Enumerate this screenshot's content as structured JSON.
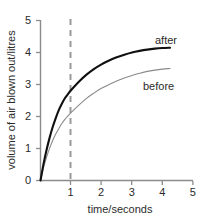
{
  "chart_data": {
    "type": "line",
    "title": "",
    "subtitle": "",
    "xlabel": "time/seconds",
    "ylabel": "volume of air blown out/litres",
    "xlim": [
      0,
      5
    ],
    "ylim": [
      0,
      5
    ],
    "xticks": [
      "1",
      "2",
      "3",
      "4",
      "5"
    ],
    "xtick_values": [
      1,
      2,
      3,
      4,
      5
    ],
    "yticks": [
      "0",
      "1",
      "2",
      "3",
      "4",
      "5"
    ],
    "ytick_values": [
      0,
      1,
      2,
      3,
      4,
      5
    ],
    "grid": false,
    "legend_position": "inline-labels",
    "series": [
      {
        "name": "after",
        "label": "after",
        "color": "#101010",
        "width": 2.1,
        "x": [
          0,
          0.1,
          0.2,
          0.3,
          0.4,
          0.5,
          0.6,
          0.7,
          0.8,
          0.9,
          1.0,
          1.25,
          1.5,
          1.75,
          2.0,
          2.25,
          2.5,
          2.75,
          3.0,
          3.25,
          3.5,
          3.75,
          4.0,
          4.25
        ],
        "values": [
          0,
          0.52,
          0.96,
          1.34,
          1.67,
          1.95,
          2.2,
          2.4,
          2.57,
          2.7,
          2.82,
          3.08,
          3.3,
          3.48,
          3.63,
          3.75,
          3.85,
          3.93,
          4.0,
          4.05,
          4.09,
          4.12,
          4.14,
          4.15
        ]
      },
      {
        "name": "before",
        "label": "before",
        "color": "#8a8a8a",
        "width": 1.1,
        "x": [
          0,
          0.1,
          0.2,
          0.3,
          0.4,
          0.5,
          0.6,
          0.7,
          0.8,
          0.9,
          1.0,
          1.25,
          1.5,
          1.75,
          2.0,
          2.25,
          2.5,
          2.75,
          3.0,
          3.25,
          3.5,
          3.75,
          4.0,
          4.25
        ],
        "values": [
          0,
          0.4,
          0.73,
          1.01,
          1.25,
          1.45,
          1.62,
          1.78,
          1.91,
          2.02,
          2.12,
          2.35,
          2.56,
          2.73,
          2.88,
          3.0,
          3.11,
          3.2,
          3.28,
          3.35,
          3.41,
          3.45,
          3.48,
          3.5
        ]
      }
    ],
    "annotations": [
      {
        "name": "reference-line",
        "type": "vline",
        "x": 1,
        "style": "dashed",
        "color": "#9a9a9a"
      }
    ],
    "axis_color": "#8c8c8c"
  }
}
